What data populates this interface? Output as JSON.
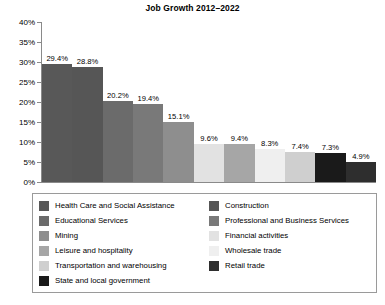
{
  "chart_data": {
    "type": "bar",
    "title": "Job Growth 2012–2022",
    "xlabel": "",
    "ylabel": "",
    "ylim": [
      0,
      40
    ],
    "ytick_labels": [
      "40%",
      "35%",
      "30%",
      "25%",
      "20%",
      "15%",
      "10%",
      "5%",
      "0%"
    ],
    "ytick_values": [
      40,
      35,
      30,
      25,
      20,
      15,
      10,
      5,
      0
    ],
    "grid": false,
    "legend_position": "bottom",
    "categories": [
      "Health Care and Social Assistance",
      "Construction",
      "Educational Services",
      "Professional and Business Services",
      "Mining",
      "Financial activities",
      "Leisure and hospitality",
      "Wholesale trade",
      "Transportation and warehousing",
      "State and local government",
      "Retail trade"
    ],
    "values": [
      29.4,
      28.8,
      20.2,
      19.4,
      15.1,
      9.6,
      9.4,
      8.3,
      7.4,
      7.3,
      4.9
    ],
    "value_labels": [
      "29.4%",
      "28.8%",
      "20.2%",
      "19.4%",
      "15.1%",
      "9.6%",
      "9.4%",
      "8.3%",
      "7.4%",
      "7.3%",
      "4.9%"
    ],
    "bar_colors": [
      "#585858",
      "#565656",
      "#6b6b6b",
      "#797979",
      "#8e8e8e",
      "#e2e2e2",
      "#a6a6a6",
      "#efefef",
      "#cfcfcf",
      "#1a1a1a",
      "#2e2e2e"
    ]
  },
  "legend": {
    "columns": [
      {
        "items": [
          {
            "label": "Health Care and Social Assistance",
            "color": "#585858"
          },
          {
            "label": "Educational Services",
            "color": "#6b6b6b"
          },
          {
            "label": "Mining",
            "color": "#8e8e8e"
          },
          {
            "label": "Leisure and hospitality",
            "color": "#a6a6a6"
          },
          {
            "label": "Transportation and warehousing",
            "color": "#cfcfcf"
          },
          {
            "label": "State and local government",
            "color": "#1a1a1a"
          }
        ]
      },
      {
        "items": [
          {
            "label": "Construction",
            "color": "#565656"
          },
          {
            "label": "Professional and Business Services",
            "color": "#797979"
          },
          {
            "label": "Financial activities",
            "color": "#e2e2e2"
          },
          {
            "label": "Wholesale trade",
            "color": "#efefef"
          },
          {
            "label": "Retail trade",
            "color": "#2e2e2e"
          }
        ]
      }
    ]
  },
  "style": {
    "axis_color": "#8a8a8a",
    "legend_border_color": "#9a9a9a",
    "background": "#ffffff",
    "text_color": "#000000"
  }
}
